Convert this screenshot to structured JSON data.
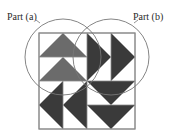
{
  "labels": {
    "part_a": "Part (a)",
    "part_b": "Part (b)"
  },
  "colors": {
    "medium_gray": "#6b6b6b",
    "dark_gray": "#3a3a3a",
    "outline": "#8a8a8a",
    "circle": "#777777",
    "background": "#ffffff"
  },
  "figure": {
    "grid": {
      "rows": 4,
      "cols": 4
    },
    "quadrants": [
      {
        "name": "top-left",
        "orientation": "up",
        "color": "medium_gray"
      },
      {
        "name": "top-right",
        "orientation": "right",
        "color": "dark_gray"
      },
      {
        "name": "bottom-left",
        "orientation": "left",
        "color": "dark_gray"
      },
      {
        "name": "bottom-right",
        "orientation": "down",
        "color": "dark_gray"
      }
    ]
  }
}
